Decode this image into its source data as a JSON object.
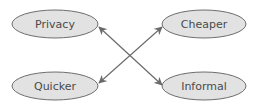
{
  "diagram": {
    "type": "concept-map",
    "nodes": [
      {
        "id": "privacy",
        "label": "Privacy",
        "cx": 55,
        "cy": 24,
        "rx": 43,
        "ry": 14
      },
      {
        "id": "cheaper",
        "label": "Cheaper",
        "cx": 204,
        "cy": 24,
        "rx": 42,
        "ry": 14
      },
      {
        "id": "quicker",
        "label": "Quicker",
        "cx": 55,
        "cy": 86,
        "rx": 43,
        "ry": 14
      },
      {
        "id": "informal",
        "label": "Informal",
        "cx": 204,
        "cy": 86,
        "rx": 42,
        "ry": 14
      }
    ],
    "edges": [
      {
        "from": "privacy",
        "to": "informal",
        "direction": "both"
      },
      {
        "from": "quicker",
        "to": "cheaper",
        "direction": "both"
      }
    ],
    "colors": {
      "node_fill": "#e2e2e2",
      "node_stroke": "#6e6e6e",
      "edge": "#6a6a6a",
      "text": "#4a4a4a",
      "background": "#ffffff"
    }
  }
}
